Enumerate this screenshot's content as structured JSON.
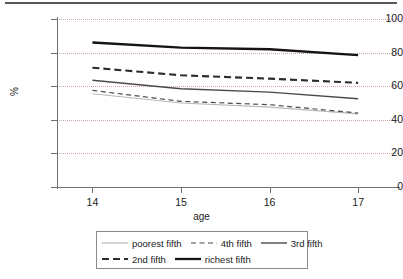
{
  "chart_data": {
    "type": "line",
    "title": "",
    "xlabel": "age",
    "ylabel": "%",
    "x": [
      14,
      15,
      16,
      17
    ],
    "xticklabels": [
      "14",
      "15",
      "16",
      "17"
    ],
    "yticklabels": [
      "0",
      "20",
      "40",
      "60",
      "80",
      "100"
    ],
    "yticks": [
      0,
      20,
      40,
      60,
      80,
      100
    ],
    "xlim": [
      13.6,
      17.45
    ],
    "ylim": [
      0,
      100
    ],
    "grid": "horizontal-dotted",
    "legend_position": "bottom-center",
    "series": [
      {
        "name": "poorest fifth",
        "values": [
          55.5,
          50.0,
          47.5,
          43.5
        ],
        "color": "#b8b8b8",
        "style": "solid",
        "width": 1.2
      },
      {
        "name": "4th fifth",
        "values": [
          57.5,
          51.0,
          49.0,
          44.0
        ],
        "color": "#4a4a4a",
        "style": "dashed",
        "width": 1.2
      },
      {
        "name": "3rd fifth",
        "values": [
          63.5,
          58.5,
          56.5,
          52.5
        ],
        "color": "#4a4a4a",
        "style": "solid",
        "width": 1.4
      },
      {
        "name": "2nd fifth",
        "values": [
          71.0,
          66.5,
          64.5,
          62.0
        ],
        "color": "#2b2b2b",
        "style": "dashed",
        "width": 2.1
      },
      {
        "name": "richest fifth",
        "values": [
          86.0,
          83.0,
          82.0,
          78.5
        ],
        "color": "#141414",
        "style": "solid",
        "width": 2.3
      }
    ],
    "legend_rows": [
      [
        "poorest fifth",
        "4th fifth",
        "3rd fifth"
      ],
      [
        "2nd fifth",
        "richest fifth"
      ]
    ]
  },
  "colors": {
    "gridline": "#c9a9a9",
    "axis": "#6f6f70",
    "top_rule": "#58585a",
    "legend_border": "#8a8a8a",
    "background": "#ffffff"
  }
}
